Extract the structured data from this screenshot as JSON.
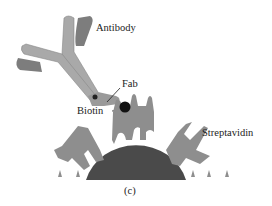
{
  "diagram": {
    "labels": {
      "antibody": "Antibody",
      "fab": "Fab",
      "biotin": "Biotin",
      "streptavidin": "Streptavidin",
      "panel": "(c)"
    },
    "colors": {
      "antibody_light": "#a9a9a9",
      "antibody_dark": "#7d7d7d",
      "streptavidin": "#8e8e8e",
      "bead": "#4a4a4a",
      "biotin": "#111111",
      "text": "#222222"
    }
  }
}
